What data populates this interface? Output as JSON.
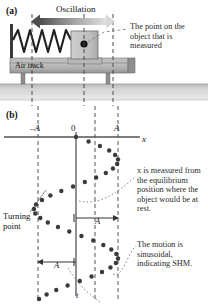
{
  "figure": {
    "panel_a": {
      "label": "(a)",
      "oscillation_label": "Oscillation",
      "air_track_label": "Air track",
      "callout": "The point on the object that is measured"
    },
    "panel_b": {
      "label": "(b)",
      "axis_x_name": "x",
      "axis_t_name": "t",
      "tick_neg_a": "–A",
      "tick_zero": "0",
      "tick_pos_a": "A",
      "amplitude_label_1": "A",
      "amplitude_label_2": "A",
      "turning_point_label": "Turning point",
      "callout_equilibrium": "x is measured from the equilibrium position where the object would be at rest.",
      "callout_sinusoidal": "The motion is sinusoidal, indicating SHM."
    }
  },
  "chart_data": {
    "type": "scatter",
    "xlabel": "x",
    "ylabel": "t",
    "orientation": "x-horizontal, t-increasing-downward",
    "xticks": [
      "–A",
      "0",
      "A"
    ],
    "xtick_values": [
      -1,
      0,
      1
    ],
    "xlim": [
      -1.35,
      1.35
    ],
    "tlim": [
      0,
      1.62
    ],
    "grid": false,
    "legend": false,
    "amplitude": 1,
    "period": 0.92,
    "note": "x = A sin(2*pi*t/T); dots are sampled at equal time intervals so they bunch at the turning points",
    "points": [
      {
        "t": 0.0,
        "x": 0.0
      },
      {
        "t": 0.045,
        "x": 0.3
      },
      {
        "t": 0.09,
        "x": 0.57
      },
      {
        "t": 0.135,
        "x": 0.79
      },
      {
        "t": 0.18,
        "x": 0.93
      },
      {
        "t": 0.225,
        "x": 1.0
      },
      {
        "t": 0.27,
        "x": 0.98
      },
      {
        "t": 0.315,
        "x": 0.88
      },
      {
        "t": 0.36,
        "x": 0.71
      },
      {
        "t": 0.405,
        "x": 0.48
      },
      {
        "t": 0.45,
        "x": 0.21
      },
      {
        "t": 0.495,
        "x": -0.07
      },
      {
        "t": 0.54,
        "x": -0.35
      },
      {
        "t": 0.585,
        "x": -0.61
      },
      {
        "t": 0.63,
        "x": -0.81
      },
      {
        "t": 0.675,
        "x": -0.95
      },
      {
        "t": 0.72,
        "x": -1.0
      },
      {
        "t": 0.765,
        "x": -0.97
      },
      {
        "t": 0.81,
        "x": -0.85
      },
      {
        "t": 0.855,
        "x": -0.67
      },
      {
        "t": 0.9,
        "x": -0.43
      },
      {
        "t": 0.945,
        "x": -0.16
      },
      {
        "t": 0.99,
        "x": 0.13
      },
      {
        "t": 1.035,
        "x": 0.41
      },
      {
        "t": 1.08,
        "x": 0.65
      },
      {
        "t": 1.125,
        "x": 0.84
      },
      {
        "t": 1.17,
        "x": 0.96
      },
      {
        "t": 1.215,
        "x": 1.0
      },
      {
        "t": 1.26,
        "x": 0.95
      },
      {
        "t": 1.305,
        "x": 0.82
      },
      {
        "t": 1.35,
        "x": 0.62
      },
      {
        "t": 1.395,
        "x": 0.37
      },
      {
        "t": 1.44,
        "x": 0.09
      },
      {
        "t": 1.485,
        "x": -0.2
      },
      {
        "t": 1.53,
        "x": -0.47
      },
      {
        "t": 1.575,
        "x": -0.7
      },
      {
        "t": 1.62,
        "x": -0.88
      }
    ]
  },
  "colors": {
    "ink": "#1a1a1a",
    "dot": "#3a3a3a",
    "axis": "#555555",
    "dashed": "#555555",
    "track_fill": "#b5b5b5",
    "track_dark": "#8e8e8e",
    "ground": "#cfcfcf",
    "block_fill": "#c9c9c9",
    "arrow_dark": "#4d4d4d",
    "arrow_light": "#dcdcdc"
  }
}
